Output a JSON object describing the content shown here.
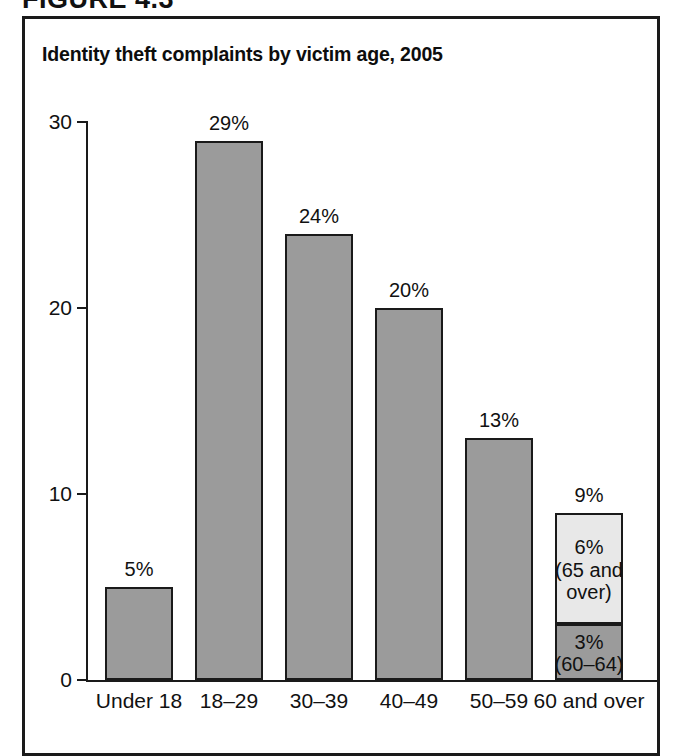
{
  "figure_label": "FIGURE 4.3",
  "chart_title": "Identity theft complaints by victim age, 2005",
  "chart_data": {
    "type": "bar",
    "title": "Identity theft complaints by victim age, 2005",
    "xlabel": "",
    "ylabel": "",
    "ylim": [
      0,
      30
    ],
    "yticks": [
      0,
      10,
      20,
      30
    ],
    "ytick_labels": [
      "0",
      "10",
      "20",
      "30"
    ],
    "grid": false,
    "legend": "none",
    "categories": [
      "Under 18",
      "18–29",
      "30–39",
      "40–49",
      "50–59",
      "60 and over"
    ],
    "values": [
      5,
      29,
      24,
      20,
      13,
      9
    ],
    "value_labels": [
      "5%",
      "29%",
      "24%",
      "20%",
      "13%",
      "9%"
    ],
    "stacked_last_bar": {
      "category": "60 and over",
      "total": 9,
      "total_label": "9%",
      "segments": [
        {
          "name": "65 and over",
          "value": 6,
          "label": "6%\n(65 and\nover)",
          "color": "#e8e8e8"
        },
        {
          "name": "60–64",
          "value": 3,
          "label": "3%\n(60–64)",
          "color": "#9b9b9b"
        }
      ]
    },
    "bar_color": "#9b9b9b",
    "bar_edge_color": "#1a1a1a",
    "axis_color": "#1a1a1a"
  }
}
